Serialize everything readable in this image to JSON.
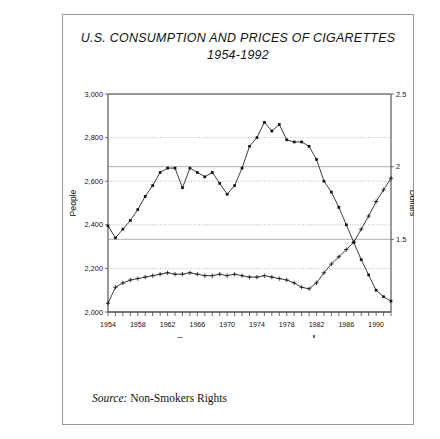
{
  "figure": {
    "title_line1": "U.S. CONSUMPTION AND PRICES OF CIGARETTES",
    "title_line2": "1954-1992",
    "source_label": "Source:",
    "source_value": "Non-Smokers Rights"
  },
  "chart_data": {
    "type": "line",
    "title": "U.S. CONSUMPTION AND PRICES OF CIGARETTES 1954-1992",
    "xlabel": "",
    "ylabel": "People",
    "y2label": "Dollars",
    "xlim": [
      1954,
      1992
    ],
    "ylim": [
      2000,
      3000
    ],
    "y2lim": [
      1.0,
      2.5
    ],
    "grid": true,
    "legend_position": "bottom",
    "ytick_labels": [
      "2,000",
      "2,200",
      "2,400",
      "2,600",
      "2,800",
      "3,000"
    ],
    "ytick_values": [
      2000,
      2200,
      2400,
      2600,
      2800,
      3000
    ],
    "y2tick_labels": [
      "1.5",
      "2",
      "2.5"
    ],
    "y2tick_values": [
      1.5,
      2.0,
      2.5
    ],
    "xtick_labels": [
      "1954",
      "1958",
      "1962",
      "1966",
      "1970",
      "1974",
      "1978",
      "1982",
      "1986",
      "1990"
    ],
    "xtick_values": [
      1954,
      1958,
      1962,
      1966,
      1970,
      1974,
      1978,
      1982,
      1986,
      1990
    ],
    "x": [
      1954,
      1955,
      1956,
      1957,
      1958,
      1959,
      1960,
      1961,
      1962,
      1963,
      1964,
      1965,
      1966,
      1967,
      1968,
      1969,
      1970,
      1971,
      1972,
      1973,
      1974,
      1975,
      1976,
      1977,
      1978,
      1979,
      1980,
      1981,
      1982,
      1983,
      1984,
      1985,
      1986,
      1987,
      1988,
      1989,
      1990,
      1991,
      1992
    ],
    "series": [
      {
        "name": "Annual per capita consumption",
        "marker": "square",
        "axis": "left",
        "values": [
          2395,
          2340,
          2380,
          2420,
          2470,
          2530,
          2580,
          2640,
          2660,
          2660,
          2570,
          2660,
          2640,
          2620,
          2640,
          2590,
          2540,
          2580,
          2660,
          2760,
          2800,
          2870,
          2830,
          2860,
          2790,
          2780,
          2780,
          2760,
          2700,
          2600,
          2550,
          2480,
          2400,
          2320,
          2240,
          2170,
          2100,
          2070,
          2050
        ]
      },
      {
        "name": "Real price of cigarettes",
        "marker": "plus",
        "axis": "right",
        "values": [
          1.06,
          1.17,
          1.2,
          1.22,
          1.23,
          1.24,
          1.25,
          1.26,
          1.27,
          1.26,
          1.26,
          1.27,
          1.26,
          1.25,
          1.25,
          1.26,
          1.25,
          1.26,
          1.25,
          1.24,
          1.24,
          1.25,
          1.24,
          1.23,
          1.22,
          1.2,
          1.17,
          1.16,
          1.2,
          1.27,
          1.33,
          1.38,
          1.43,
          1.48,
          1.57,
          1.66,
          1.76,
          1.84,
          1.92
        ]
      }
    ]
  },
  "legend": [
    {
      "label": "Annual per capita consumption",
      "marker": "square-line"
    },
    {
      "label": "Real price of cigarettes",
      "marker": "plus"
    }
  ]
}
